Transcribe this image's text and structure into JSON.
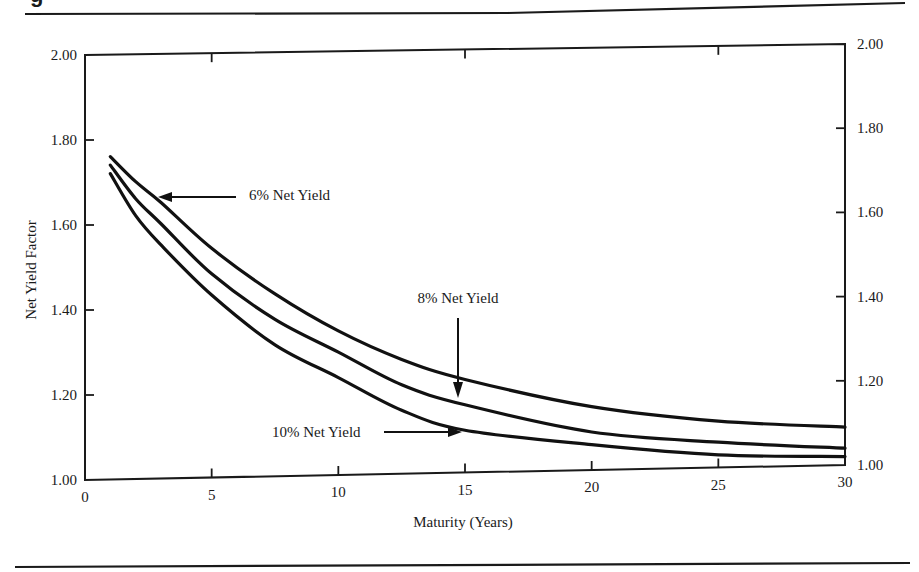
{
  "figure": {
    "header_fragment": "g",
    "top_rule": true,
    "bottom_rule": true
  },
  "chart_data": {
    "type": "line",
    "title": "",
    "xlabel": "Maturity (Years)",
    "ylabel": "Net Yield Factor",
    "xlim": [
      0,
      30
    ],
    "ylim": [
      1.0,
      2.0
    ],
    "x_ticks": [
      0,
      5,
      10,
      15,
      20,
      25,
      30
    ],
    "x_tick_labels": [
      "0",
      "5",
      "10",
      "15",
      "20",
      "25",
      "30"
    ],
    "y_ticks": [
      1.0,
      1.2,
      1.4,
      1.6,
      1.8,
      2.0
    ],
    "y_tick_labels": [
      "1.00",
      "1.20",
      "1.40",
      "1.60",
      "1.80",
      "2.00"
    ],
    "right_axis_tick_labels": [
      "1.00",
      "1.20",
      "1.40",
      "1.60",
      "1.80",
      "2.00"
    ],
    "grid": false,
    "legend": "none (inline arrow annotations)",
    "x": [
      1,
      2,
      3,
      5,
      7.5,
      10,
      12.5,
      15,
      20,
      25,
      30
    ],
    "series": [
      {
        "name": "6% Net Yield",
        "values": [
          1.76,
          1.7,
          1.65,
          1.54,
          1.43,
          1.34,
          1.27,
          1.22,
          1.15,
          1.11,
          1.09
        ]
      },
      {
        "name": "8% Net Yield",
        "values": [
          1.74,
          1.66,
          1.6,
          1.48,
          1.37,
          1.29,
          1.21,
          1.16,
          1.09,
          1.06,
          1.04
        ]
      },
      {
        "name": "10% Net Yield",
        "values": [
          1.72,
          1.62,
          1.55,
          1.43,
          1.31,
          1.23,
          1.15,
          1.1,
          1.06,
          1.03,
          1.02
        ]
      }
    ],
    "annotations": [
      {
        "text": "6% Net Yield",
        "target_series": 0,
        "arrow": "left"
      },
      {
        "text": "8% Net Yield",
        "target_series": 1,
        "arrow": "down"
      },
      {
        "text": "10% Net Yield",
        "target_series": 2,
        "arrow": "right"
      }
    ]
  }
}
